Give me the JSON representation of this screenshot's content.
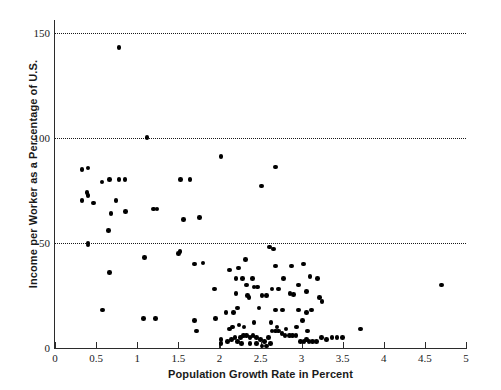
{
  "chart_data": {
    "type": "scatter",
    "title": "",
    "xlabel": "Population Growth Rate in Percent",
    "ylabel": "Income per Worker as a Percentage of U.S.",
    "xlim": [
      0,
      5
    ],
    "ylim": [
      0,
      155
    ],
    "xticks": [
      0,
      0.5,
      1,
      1.5,
      2,
      2.5,
      3,
      3.5,
      4,
      4.5,
      5
    ],
    "xticklabels": [
      "0",
      "0.5",
      "1",
      "1.5",
      "2",
      "2.5",
      "3",
      "3.5",
      "4",
      "4.5",
      "5"
    ],
    "yticks": [
      0,
      50,
      100,
      150
    ],
    "yticklabels": [
      "0",
      "50",
      "100",
      "150"
    ],
    "gridlines": {
      "y": [
        50,
        100,
        150
      ],
      "style": "dotted",
      "x": "off"
    },
    "legend": "none",
    "marker": {
      "shape": "circle",
      "color": "#000000",
      "size": 4.6
    },
    "points": [
      [
        0.78,
        143
      ],
      [
        1.12,
        100
      ],
      [
        2.02,
        91
      ],
      [
        0.33,
        85
      ],
      [
        0.4,
        85.5
      ],
      [
        0.57,
        79
      ],
      [
        0.66,
        80
      ],
      [
        0.78,
        80
      ],
      [
        0.85,
        80
      ],
      [
        1.53,
        80
      ],
      [
        1.64,
        80
      ],
      [
        2.68,
        86
      ],
      [
        0.39,
        74
      ],
      [
        0.4,
        72.5
      ],
      [
        2.51,
        77
      ],
      [
        0.33,
        70
      ],
      [
        0.47,
        69
      ],
      [
        0.74,
        70
      ],
      [
        0.68,
        64
      ],
      [
        0.86,
        65
      ],
      [
        1.2,
        66
      ],
      [
        1.24,
        66
      ],
      [
        1.56,
        61
      ],
      [
        1.76,
        62
      ],
      [
        0.65,
        56
      ],
      [
        0.4,
        50
      ],
      [
        0.4,
        49
      ],
      [
        1.5,
        45
      ],
      [
        1.52,
        46
      ],
      [
        1.09,
        43
      ],
      [
        1.7,
        40
      ],
      [
        1.8,
        40.5
      ],
      [
        2.32,
        42
      ],
      [
        2.61,
        48
      ],
      [
        2.66,
        47
      ],
      [
        0.66,
        36
      ],
      [
        2.12,
        37
      ],
      [
        2.23,
        38
      ],
      [
        2.68,
        39
      ],
      [
        2.88,
        39
      ],
      [
        3.02,
        40
      ],
      [
        2.2,
        33
      ],
      [
        2.28,
        33
      ],
      [
        2.4,
        33
      ],
      [
        2.78,
        33
      ],
      [
        3.1,
        34
      ],
      [
        3.19,
        33
      ],
      [
        4.7,
        30
      ],
      [
        1.94,
        28
      ],
      [
        2.33,
        30
      ],
      [
        2.42,
        29
      ],
      [
        2.46,
        29
      ],
      [
        2.64,
        28
      ],
      [
        2.72,
        28
      ],
      [
        2.96,
        30
      ],
      [
        2.2,
        26
      ],
      [
        2.34,
        25
      ],
      [
        2.36,
        24
      ],
      [
        2.52,
        25
      ],
      [
        2.57,
        25
      ],
      [
        2.86,
        26
      ],
      [
        2.9,
        25.5
      ],
      [
        3.06,
        27
      ],
      [
        3.22,
        24
      ],
      [
        3.25,
        22
      ],
      [
        0.58,
        18
      ],
      [
        1.08,
        14
      ],
      [
        1.22,
        14
      ],
      [
        1.7,
        13
      ],
      [
        1.95,
        14
      ],
      [
        2.08,
        17
      ],
      [
        2.17,
        17
      ],
      [
        2.22,
        19
      ],
      [
        2.48,
        19
      ],
      [
        2.68,
        18
      ],
      [
        2.77,
        18
      ],
      [
        2.96,
        18
      ],
      [
        3.06,
        17
      ],
      [
        3.12,
        18
      ],
      [
        1.72,
        8
      ],
      [
        2.02,
        4
      ],
      [
        2.12,
        9
      ],
      [
        2.16,
        10
      ],
      [
        2.24,
        11
      ],
      [
        2.3,
        10
      ],
      [
        2.42,
        12
      ],
      [
        2.63,
        12
      ],
      [
        2.7,
        10
      ],
      [
        2.81,
        9
      ],
      [
        2.94,
        10
      ],
      [
        3.01,
        13
      ],
      [
        3.07,
        8
      ],
      [
        2.02,
        2
      ],
      [
        2.1,
        3
      ],
      [
        2.15,
        4
      ],
      [
        2.19,
        5
      ],
      [
        2.22,
        3
      ],
      [
        2.26,
        5
      ],
      [
        2.29,
        6
      ],
      [
        2.33,
        6
      ],
      [
        2.37,
        5
      ],
      [
        2.41,
        6
      ],
      [
        2.45,
        5
      ],
      [
        2.5,
        4
      ],
      [
        2.55,
        3
      ],
      [
        2.6,
        5
      ],
      [
        2.64,
        8
      ],
      [
        2.68,
        8
      ],
      [
        2.72,
        8
      ],
      [
        2.76,
        7
      ],
      [
        2.8,
        6
      ],
      [
        2.85,
        6
      ],
      [
        2.89,
        6
      ],
      [
        2.93,
        6
      ],
      [
        2.99,
        3
      ],
      [
        3.03,
        3
      ],
      [
        3.06,
        4
      ],
      [
        3.09,
        3
      ],
      [
        3.13,
        3
      ],
      [
        3.18,
        3
      ],
      [
        3.24,
        5
      ],
      [
        3.3,
        4
      ],
      [
        3.37,
        5
      ],
      [
        3.43,
        5
      ],
      [
        3.5,
        5
      ],
      [
        3.72,
        9
      ],
      [
        2.52,
        1
      ],
      [
        2.57,
        1
      ],
      [
        2.62,
        2
      ],
      [
        2.45,
        2
      ],
      [
        2.37,
        2
      ],
      [
        2.27,
        2
      ]
    ]
  }
}
